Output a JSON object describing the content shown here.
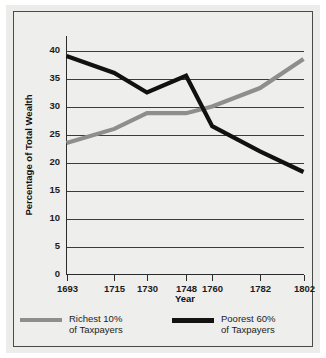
{
  "chart_data": {
    "type": "line",
    "title": "",
    "xlabel": "Year",
    "ylabel": "Percentage of Total Wealth",
    "categories": [
      "1693",
      "1715",
      "1730",
      "1748",
      "1760",
      "1782",
      "1802"
    ],
    "x": [
      1693,
      1715,
      1730,
      1748,
      1760,
      1782,
      1802
    ],
    "xlim": [
      1693,
      1802
    ],
    "ylim": [
      0,
      40
    ],
    "yticks": [
      0,
      5,
      10,
      15,
      20,
      25,
      30,
      35,
      40
    ],
    "ytick_labels": [
      "0",
      "5",
      "10",
      "15",
      "20",
      "25",
      "30",
      "35",
      "40"
    ],
    "grid": "horizontal",
    "legend_position": "below",
    "series": [
      {
        "name": "Richest 10% of Taxpayers",
        "color": "#8e8e8e",
        "values": [
          23.5,
          26.0,
          28.8,
          28.8,
          30.0,
          33.3,
          38.5
        ]
      },
      {
        "name": "Poorest 60% of Taxpayers",
        "color": "#111111",
        "values": [
          39.0,
          36.0,
          32.5,
          35.5,
          26.5,
          22.0,
          18.3
        ]
      }
    ]
  },
  "axes": {
    "y_title": "Percentage of Total Wealth",
    "x_title": "Year"
  },
  "legend": {
    "entries": [
      {
        "swatch": "gray",
        "line1": "Richest 10%",
        "line2": "of Taxpayers"
      },
      {
        "swatch": "black",
        "line1": "Poorest 60%",
        "line2": "of Taxpayers"
      }
    ]
  }
}
